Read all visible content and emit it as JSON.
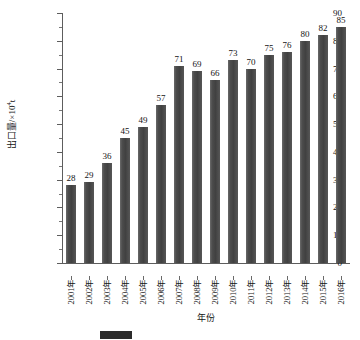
{
  "chart_data": {
    "type": "bar",
    "title": "",
    "subtitle": "",
    "xlabel": "年份",
    "ylabel": "出口量/×10⁴t",
    "ylabel_main": "出口量/×10",
    "ylabel_exp": "4",
    "ylabel_unit": "t",
    "ylim": [
      0,
      90
    ],
    "ytick_step": 10,
    "yminor_step": 5,
    "grid": false,
    "legend_position": "bottom",
    "categories": [
      "2001年",
      "2002年",
      "2003年",
      "2004年",
      "2005年",
      "2006年",
      "2007年",
      "2008年",
      "2009年",
      "2010年",
      "2011年",
      "2012年",
      "2013年",
      "2014年",
      "2015年",
      "2016年"
    ],
    "values": [
      28,
      29,
      36,
      45,
      49,
      57,
      71,
      69,
      66,
      73,
      70,
      75,
      76,
      80,
      82,
      85
    ],
    "ytick_labels": [
      "0",
      "10",
      "20",
      "30",
      "40",
      "50",
      "60",
      "70",
      "80",
      "90"
    ],
    "bar_color": "#4a4a4a",
    "axis_color": "#5d5d5d",
    "text_color": "#141414",
    "data_labels_shown": true
  },
  "caption": {
    "swatch_color": "#2b2b2b",
    "text": ""
  }
}
